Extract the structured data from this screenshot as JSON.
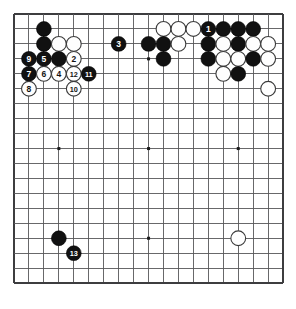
{
  "diagram": {
    "type": "go-board-diagram",
    "board_size": 19,
    "colors": {
      "black_stone": "#111111",
      "white_stone": "#fefefe",
      "grid_line": "#58585a",
      "board_background": "#ffffff",
      "border": "#3d3d3f"
    },
    "geometry": {
      "origin_x": 14,
      "origin_y": 14,
      "spacing": 14.95,
      "stone_radius": 7.4,
      "label_font_size": 8.5
    },
    "star_points": [
      {
        "col": 3,
        "row": 3
      },
      {
        "col": 9,
        "row": 3
      },
      {
        "col": 15,
        "row": 3
      },
      {
        "col": 3,
        "row": 9
      },
      {
        "col": 9,
        "row": 9
      },
      {
        "col": 15,
        "row": 9
      },
      {
        "col": 3,
        "row": 15
      },
      {
        "col": 9,
        "row": 15
      },
      {
        "col": 15,
        "row": 15
      }
    ],
    "stones": [
      {
        "col": 2,
        "row": 1,
        "color": "black",
        "label": ""
      },
      {
        "col": 2,
        "row": 2,
        "color": "black",
        "label": ""
      },
      {
        "col": 3,
        "row": 2,
        "color": "white",
        "label": ""
      },
      {
        "col": 4,
        "row": 2,
        "color": "white",
        "label": ""
      },
      {
        "col": 1,
        "row": 3,
        "color": "black",
        "label": "9"
      },
      {
        "col": 2,
        "row": 3,
        "color": "black",
        "label": "5"
      },
      {
        "col": 3,
        "row": 3,
        "color": "black",
        "label": ""
      },
      {
        "col": 4,
        "row": 3,
        "color": "white",
        "label": "2"
      },
      {
        "col": 1,
        "row": 4,
        "color": "black",
        "label": "7"
      },
      {
        "col": 2,
        "row": 4,
        "color": "white",
        "label": "6"
      },
      {
        "col": 3,
        "row": 4,
        "color": "white",
        "label": "4"
      },
      {
        "col": 4,
        "row": 4,
        "color": "white",
        "label": "12"
      },
      {
        "col": 5,
        "row": 4,
        "color": "black",
        "label": "11"
      },
      {
        "col": 1,
        "row": 5,
        "color": "white",
        "label": "8"
      },
      {
        "col": 4,
        "row": 5,
        "color": "white",
        "label": "10"
      },
      {
        "col": 7,
        "row": 2,
        "color": "black",
        "label": "3"
      },
      {
        "col": 9,
        "row": 2,
        "color": "black",
        "label": ""
      },
      {
        "col": 10,
        "row": 1,
        "color": "white",
        "label": ""
      },
      {
        "col": 11,
        "row": 1,
        "color": "white",
        "label": ""
      },
      {
        "col": 12,
        "row": 1,
        "color": "white",
        "label": ""
      },
      {
        "col": 13,
        "row": 1,
        "color": "black",
        "label": "1"
      },
      {
        "col": 14,
        "row": 1,
        "color": "black",
        "label": ""
      },
      {
        "col": 15,
        "row": 1,
        "color": "black",
        "label": ""
      },
      {
        "col": 16,
        "row": 1,
        "color": "black",
        "label": ""
      },
      {
        "col": 10,
        "row": 2,
        "color": "black",
        "label": ""
      },
      {
        "col": 11,
        "row": 2,
        "color": "white",
        "label": ""
      },
      {
        "col": 13,
        "row": 2,
        "color": "black",
        "label": ""
      },
      {
        "col": 14,
        "row": 2,
        "color": "white",
        "label": ""
      },
      {
        "col": 15,
        "row": 2,
        "color": "black",
        "label": ""
      },
      {
        "col": 16,
        "row": 2,
        "color": "white",
        "label": ""
      },
      {
        "col": 17,
        "row": 2,
        "color": "white",
        "label": ""
      },
      {
        "col": 10,
        "row": 3,
        "color": "black",
        "label": ""
      },
      {
        "col": 13,
        "row": 3,
        "color": "black",
        "label": ""
      },
      {
        "col": 14,
        "row": 3,
        "color": "white",
        "label": ""
      },
      {
        "col": 15,
        "row": 3,
        "color": "white",
        "label": ""
      },
      {
        "col": 16,
        "row": 3,
        "color": "black",
        "label": ""
      },
      {
        "col": 17,
        "row": 3,
        "color": "white",
        "label": ""
      },
      {
        "col": 14,
        "row": 4,
        "color": "white",
        "label": ""
      },
      {
        "col": 15,
        "row": 4,
        "color": "black",
        "label": ""
      },
      {
        "col": 17,
        "row": 5,
        "color": "white",
        "label": ""
      },
      {
        "col": 3,
        "row": 15,
        "color": "black",
        "label": ""
      },
      {
        "col": 4,
        "row": 16,
        "color": "black",
        "label": "13"
      },
      {
        "col": 15,
        "row": 15,
        "color": "white",
        "label": ""
      }
    ],
    "move_numbers": [
      "1",
      "2",
      "3",
      "4",
      "5",
      "6",
      "7",
      "8",
      "9",
      "10",
      "11",
      "12",
      "13"
    ]
  }
}
